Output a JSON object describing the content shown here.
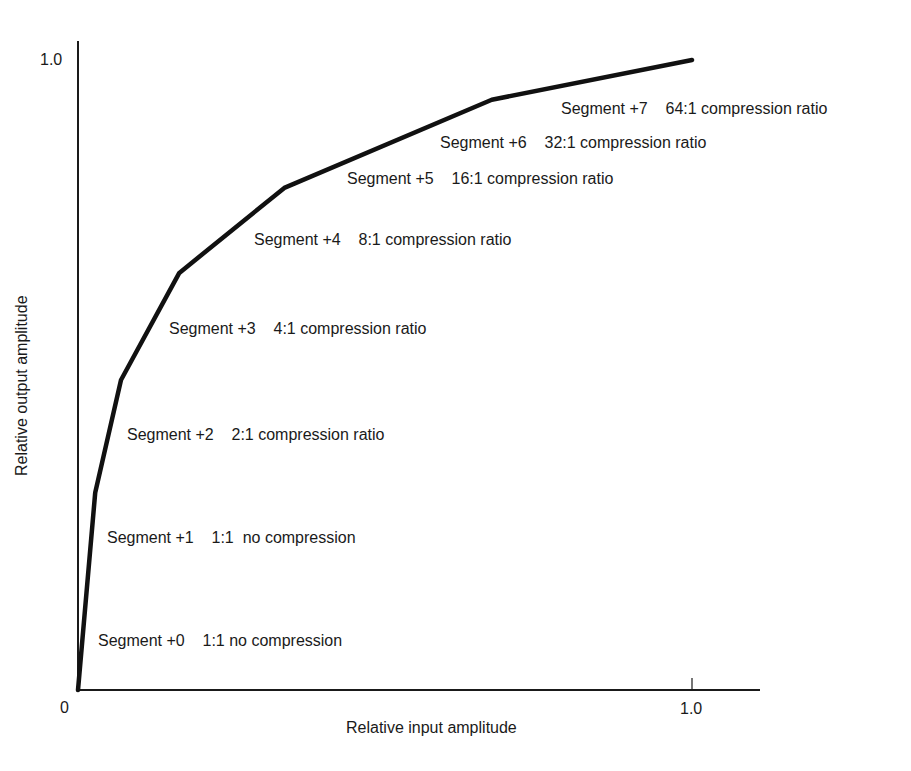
{
  "chart_data": {
    "type": "line",
    "title": "",
    "xlabel": "Relative input amplitude",
    "ylabel": "Relative output amplitude",
    "xlim": [
      0,
      1.0
    ],
    "ylim": [
      0,
      1.0
    ],
    "grid": false,
    "legend": null,
    "x_ticks": [
      "0",
      "1.0"
    ],
    "y_ticks": [
      "1.0"
    ],
    "series": [
      {
        "name": "Compression curve",
        "x": [
          0.0,
          0.028,
          0.07,
          0.165,
          0.336,
          0.674,
          1.0
        ],
        "y": [
          0.0,
          0.313,
          0.492,
          0.662,
          0.797,
          0.937,
          1.0
        ]
      }
    ],
    "annotations": [
      {
        "segment": "Segment +0",
        "ratio": "1:1 no compression"
      },
      {
        "segment": "Segment +1",
        "ratio": "1:1  no compression"
      },
      {
        "segment": "Segment +2",
        "ratio": "2:1 compression ratio"
      },
      {
        "segment": "Segment +3",
        "ratio": "4:1 compression ratio"
      },
      {
        "segment": "Segment +4",
        "ratio": "8:1 compression ratio"
      },
      {
        "segment": "Segment +5",
        "ratio": "16:1 compression ratio"
      },
      {
        "segment": "Segment +6",
        "ratio": "32:1 compression ratio"
      },
      {
        "segment": "Segment +7",
        "ratio": "64:1 compression ratio"
      }
    ]
  },
  "axes": {
    "origin_label": "0",
    "x_max_label": "1.0",
    "y_max_label": "1.0",
    "x_title": "Relative input amplitude",
    "y_title": "Relative output amplitude"
  },
  "labels": [
    "Segment +0    1:1 no compression",
    "Segment +1    1:1  no compression",
    "Segment +2    2:1 compression ratio",
    "Segment +3    4:1 compression ratio",
    "Segment +4    8:1 compression ratio",
    "Segment +5    16:1 compression ratio",
    "Segment +6    32:1 compression ratio",
    "Segment +7    64:1 compression ratio"
  ],
  "colors": {
    "line": "#111111",
    "axis": "#1a1a1a",
    "text": "#1a1a1a",
    "background": "#ffffff"
  }
}
